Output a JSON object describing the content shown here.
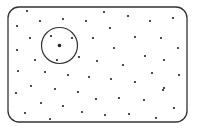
{
  "diagram": {
    "width": 197,
    "height": 132,
    "colors": {
      "background": "#ffffff",
      "frame": "#333333",
      "dot": "#222222",
      "circle": "#333333"
    },
    "frame": {
      "x": 8,
      "y": 7,
      "width": 179,
      "height": 115,
      "radius": 11,
      "stroke_width": 1.3
    },
    "neighborhood": {
      "center": {
        "x": 59.5,
        "y": 45.5
      },
      "radius": 18,
      "center_dot_radius": 1.8,
      "stroke_width": 1.2
    },
    "dot_radius": 1.1,
    "points": [
      [
        27,
        11
      ],
      [
        63,
        19
      ],
      [
        86,
        21
      ],
      [
        104,
        12
      ],
      [
        128,
        16
      ],
      [
        150,
        21
      ],
      [
        173,
        18
      ],
      [
        17,
        26
      ],
      [
        40,
        21
      ],
      [
        110,
        28
      ],
      [
        30,
        38
      ],
      [
        51,
        36
      ],
      [
        72,
        38
      ],
      [
        93,
        38
      ],
      [
        135,
        37
      ],
      [
        161,
        38
      ],
      [
        114,
        48
      ],
      [
        178,
        48
      ],
      [
        17,
        50
      ],
      [
        57,
        60
      ],
      [
        35,
        60
      ],
      [
        79,
        57
      ],
      [
        97,
        61
      ],
      [
        145,
        56
      ],
      [
        164,
        60
      ],
      [
        18,
        71
      ],
      [
        45,
        72
      ],
      [
        68,
        75
      ],
      [
        89,
        77
      ],
      [
        123,
        65
      ],
      [
        152,
        73
      ],
      [
        179,
        75
      ],
      [
        31,
        86
      ],
      [
        55,
        89
      ],
      [
        78,
        92
      ],
      [
        111,
        79
      ],
      [
        135,
        82
      ],
      [
        164,
        88
      ],
      [
        16,
        93
      ],
      [
        96,
        99
      ],
      [
        119,
        98
      ],
      [
        163,
        90
      ],
      [
        41,
        103
      ],
      [
        63,
        106
      ],
      [
        144,
        100
      ],
      [
        174,
        108
      ],
      [
        25,
        113
      ],
      [
        50,
        119
      ],
      [
        82,
        112
      ],
      [
        105,
        115
      ],
      [
        129,
        114
      ],
      [
        156,
        118
      ]
    ]
  }
}
